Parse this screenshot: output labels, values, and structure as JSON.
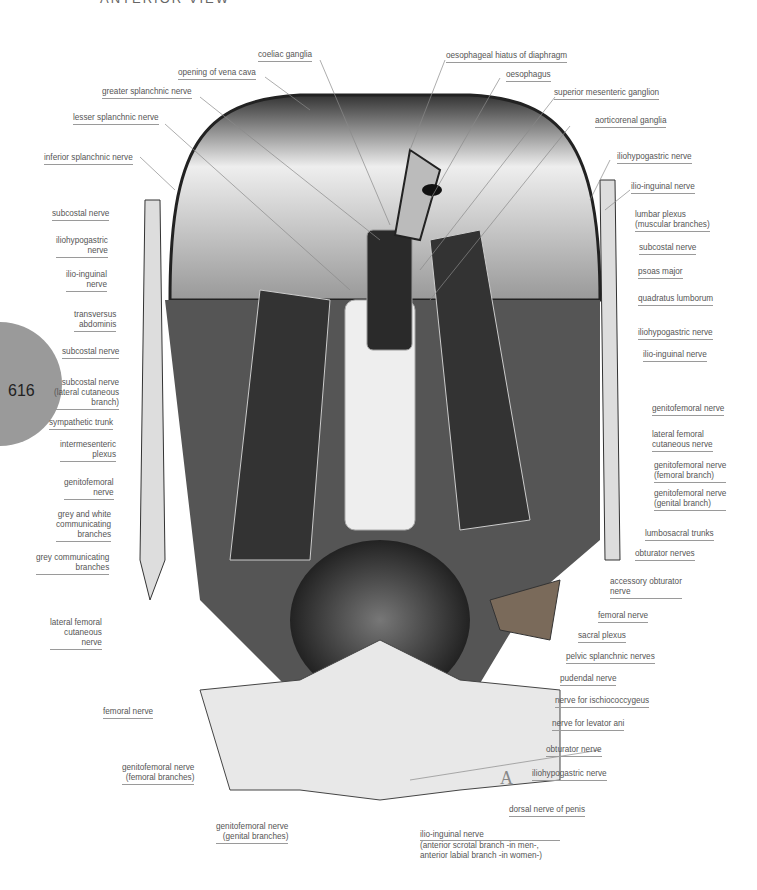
{
  "header": {
    "view_title": "ANTERIOR VIEW"
  },
  "page": {
    "number": "616",
    "badge_color": "#9a9a9a"
  },
  "figure": {
    "letter": "A",
    "labels_top": [
      {
        "id": "coeliac-ganglia",
        "text": "coeliac ganglia"
      },
      {
        "id": "opening-of-vena-cava",
        "text": "opening of vena cava"
      },
      {
        "id": "greater-splanchnic-nerve",
        "text": "greater splanchnic nerve"
      },
      {
        "id": "lesser-splanchnic-nerve",
        "text": "lesser splanchnic nerve"
      },
      {
        "id": "oesophageal-hiatus",
        "text": "oesophageal hiatus of diaphragm"
      },
      {
        "id": "oesophagus",
        "text": "oesophagus"
      },
      {
        "id": "superior-mesenteric-ganglion",
        "text": "superior mesenteric ganglion"
      },
      {
        "id": "aorticorenal-ganglia",
        "text": "aorticorenal ganglia"
      }
    ],
    "labels_left": [
      {
        "id": "inferior-splanchnic-nerve",
        "text": "inferior splanchnic nerve"
      },
      {
        "id": "subcostal-nerve-l1",
        "text": "subcostal nerve"
      },
      {
        "id": "iliohypogastric-nerve-l",
        "line1": "iliohypogastric",
        "line2": "nerve"
      },
      {
        "id": "ilio-inguinal-nerve-l",
        "line1": "ilio-inguinal",
        "line2": "nerve"
      },
      {
        "id": "transversus-abdominis",
        "line1": "transversus",
        "line2": "abdominis"
      },
      {
        "id": "subcostal-nerve-l2",
        "text": "subcostal nerve"
      },
      {
        "id": "subcostal-nerve-lateral",
        "line1": "subcostal nerve",
        "line2": "(lateral cutaneous",
        "line3": "branch)"
      },
      {
        "id": "sympathetic-trunk",
        "text": "sympathetic trunk"
      },
      {
        "id": "intermesenteric-plexus",
        "line1": "intermesenteric",
        "line2": "plexus"
      },
      {
        "id": "genitofemoral-nerve-l",
        "line1": "genitofemoral",
        "line2": "nerve"
      },
      {
        "id": "grey-white-communicating",
        "line1": "grey and white",
        "line2": "communicating",
        "line3": "branches"
      },
      {
        "id": "grey-communicating",
        "line1": "grey communicating",
        "line2": "branches"
      },
      {
        "id": "lateral-femoral-cutaneous-l",
        "line1": "lateral femoral",
        "line2": "cutaneous",
        "line3": "nerve"
      },
      {
        "id": "femoral-nerve-l",
        "text": "femoral nerve"
      },
      {
        "id": "genitofemoral-femoral-branches",
        "line1": "genitofemoral nerve",
        "line2": "(femoral branches)"
      },
      {
        "id": "genitofemoral-genital-branches",
        "line1": "genitofemoral nerve",
        "line2": "(genital branches)"
      }
    ],
    "labels_right": [
      {
        "id": "iliohypogastric-nerve-r1",
        "text": "iliohypogastric nerve"
      },
      {
        "id": "ilio-inguinal-nerve-r1",
        "text": "ilio-inguinal nerve"
      },
      {
        "id": "lumbar-plexus",
        "line1": "lumbar plexus",
        "line2": "(muscular branches)"
      },
      {
        "id": "subcostal-nerve-r",
        "text": "subcostal nerve"
      },
      {
        "id": "psoas-major",
        "text": "psoas major"
      },
      {
        "id": "quadratus-lumborum",
        "text": "quadratus lumborum"
      },
      {
        "id": "iliohypogastric-nerve-r2",
        "text": "iliohypogastric nerve"
      },
      {
        "id": "ilio-inguinal-nerve-r2",
        "text": "ilio-inguinal nerve"
      },
      {
        "id": "genitofemoral-nerve-r",
        "text": "genitofemoral nerve"
      },
      {
        "id": "lateral-femoral-cutaneous-r",
        "line1": "lateral femoral",
        "line2": "cutaneous nerve"
      },
      {
        "id": "genitofemoral-femoral-branch",
        "line1": "genitofemoral nerve",
        "line2": "(femoral branch)"
      },
      {
        "id": "genitofemoral-genital-branch",
        "line1": "genitofemoral nerve",
        "line2": "(genital branch)"
      },
      {
        "id": "lumbosacral-trunks",
        "text": "lumbosacral trunks"
      },
      {
        "id": "obturator-nerves",
        "text": "obturator nerves"
      },
      {
        "id": "accessory-obturator",
        "line1": "accessory obturator",
        "line2": "nerve"
      },
      {
        "id": "femoral-nerve-r",
        "text": "femoral nerve"
      },
      {
        "id": "sacral-plexus",
        "text": "sacral plexus"
      },
      {
        "id": "pelvic-splanchnic",
        "text": "pelvic splanchnic nerves"
      },
      {
        "id": "pudendal-nerve",
        "text": "pudendal nerve"
      },
      {
        "id": "nerve-ischiococcygeus",
        "text": "nerve for ischiococcygeus"
      },
      {
        "id": "nerve-levator-ani",
        "text": "nerve for levator ani"
      },
      {
        "id": "obturator-nerve",
        "text": "obturator nerve"
      },
      {
        "id": "iliohypogastric-nerve-r3",
        "text": "iliohypogastric nerve"
      },
      {
        "id": "dorsal-nerve-penis",
        "text": "dorsal nerve of penis"
      },
      {
        "id": "ilio-inguinal-anterior",
        "line1": "ilio-inguinal nerve",
        "line2": "(anterior scrotal branch -in men-,",
        "line3": "anterior labial branch -in women-)"
      }
    ]
  }
}
